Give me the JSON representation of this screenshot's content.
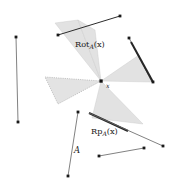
{
  "figure": {
    "title": "",
    "background_color": "#ffffff",
    "width": 174,
    "height": 190,
    "cone_fill_color": "#e2e2e2",
    "cone_stroke_color": "#b4b4b4",
    "line_color": "#5a5a5a",
    "thick_line_color": "#262626",
    "point_color": "#1a1a1a",
    "center_point": {
      "x": 101,
      "y": 81
    },
    "labels": {
      "rotation_main": "Rot",
      "rotation_subscript": "A",
      "rotation_argument": "(x)",
      "reflection_main": "Rp",
      "reflection_subscript": "A",
      "reflection_argument": "(x)",
      "center_label": "x",
      "set_label": "A"
    },
    "cones": [
      {
        "name": "cone-upper-left",
        "fill": "#e2e2e2",
        "dashed": false,
        "points": "101,81 56,24 76,21"
      },
      {
        "name": "cone-upper-left-wide",
        "fill": "#e2e2e2",
        "dashed": false,
        "points": "101,81 76,21 93,31"
      },
      {
        "name": "cone-right",
        "fill": "#e2e2e2",
        "dashed": false,
        "points": "101,81 151,81 140,56"
      },
      {
        "name": "cone-lower-right",
        "fill": "#e2e2e2",
        "dashed": false,
        "points": "101,81 94,120 142,123"
      },
      {
        "name": "cone-left-dotted",
        "fill": "#e0e0e0",
        "dashed": true,
        "points": "101,81 46,78 59,103"
      }
    ],
    "segments": [
      {
        "name": "segment-left-vertical",
        "x1": 16,
        "y1": 37,
        "x2": 18,
        "y2": 122,
        "width": 0.8,
        "color": "#5a5a5a",
        "dot_start": true,
        "dot_end": true
      },
      {
        "name": "segment-top-diagonal",
        "x1": 58,
        "y1": 35,
        "x2": 120,
        "y2": 16,
        "width": 0.9,
        "color": "#2c2c2c",
        "dot_start": true,
        "dot_end": true
      },
      {
        "name": "segment-right-thin",
        "x1": 129,
        "y1": 38,
        "x2": 152,
        "y2": 82,
        "width": 0.8,
        "color": "#5a5a5a",
        "dot_start": true,
        "dot_end": false
      },
      {
        "name": "segment-right-thick",
        "x1": 131,
        "y1": 41,
        "x2": 153,
        "y2": 82,
        "width": 1.9,
        "color": "#262626",
        "dot_start": false,
        "dot_end": true
      },
      {
        "name": "segment-bottom-left-A",
        "x1": 78,
        "y1": 112,
        "x2": 68,
        "y2": 176,
        "width": 0.8,
        "color": "#5a5a5a",
        "dot_start": true,
        "dot_end": true
      },
      {
        "name": "segment-bottom-thick",
        "x1": 89,
        "y1": 113,
        "x2": 128,
        "y2": 131,
        "width": 2.0,
        "color": "#262626",
        "dot_start": false,
        "dot_end": false
      },
      {
        "name": "segment-bottom-long-diagonal",
        "x1": 89,
        "y1": 113,
        "x2": 163,
        "y2": 146,
        "width": 0.8,
        "color": "#5a5a5a",
        "dot_start": false,
        "dot_end": true
      },
      {
        "name": "segment-bottom-horizontal",
        "x1": 99,
        "y1": 156,
        "x2": 144,
        "y2": 148,
        "width": 0.8,
        "color": "#5a5a5a",
        "dot_start": true,
        "dot_end": true
      }
    ],
    "label_positions": {
      "rotation": {
        "x": 75,
        "y": 47
      },
      "reflection": {
        "x": 93,
        "y": 133
      },
      "center": {
        "x": 106,
        "y": 87
      },
      "set": {
        "x": 76,
        "y": 151
      }
    }
  }
}
